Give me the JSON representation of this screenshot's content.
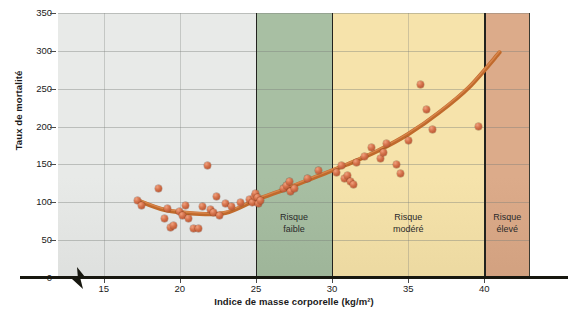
{
  "chart_data": {
    "type": "scatter",
    "title": "",
    "xlabel": "Indice de masse corporelle (kg/m²)",
    "ylabel": "Taux de mortalité",
    "xlim": [
      12,
      43
    ],
    "ylim": [
      0,
      350
    ],
    "xticks": [
      15,
      20,
      25,
      30,
      35,
      40
    ],
    "yticks": [
      0,
      50,
      100,
      150,
      200,
      250,
      300,
      350
    ],
    "grid": true,
    "legend": "none",
    "axis_break_x": true,
    "x": [
      17.2,
      17.5,
      18.6,
      19.0,
      19.2,
      19.4,
      19.6,
      20.0,
      20.2,
      20.4,
      20.6,
      20.9,
      21.2,
      21.5,
      21.8,
      22.0,
      22.2,
      22.4,
      22.6,
      23.0,
      23.4,
      24.0,
      24.6,
      24.8,
      24.9,
      25.0,
      25.1,
      25.2,
      25.3,
      26.8,
      27.0,
      27.2,
      27.3,
      27.5,
      28.4,
      29.1,
      30.3,
      30.6,
      30.8,
      31.0,
      31.2,
      31.4,
      31.6,
      32.1,
      32.6,
      33.2,
      33.4,
      33.6,
      34.2,
      34.5,
      35.0,
      35.8,
      36.2,
      36.6,
      39.6
    ],
    "y": [
      103,
      96,
      118,
      78,
      92,
      67,
      70,
      88,
      83,
      96,
      78,
      66,
      66,
      95,
      148,
      90,
      86,
      108,
      82,
      98,
      95,
      100,
      104,
      100,
      108,
      112,
      106,
      98,
      103,
      118,
      122,
      128,
      114,
      118,
      132,
      142,
      140,
      148,
      132,
      136,
      128,
      124,
      152,
      160,
      172,
      158,
      166,
      178,
      150,
      138,
      182,
      256,
      222,
      196,
      200
    ],
    "series": [
      {
        "name": "Taux de mortalité observé",
        "type": "scatter",
        "marker_color": "#c96a44"
      },
      {
        "name": "Courbe de tendance",
        "type": "line",
        "line_color": "#c06a2c",
        "points": [
          {
            "x": 17.3,
            "y": 102
          },
          {
            "x": 19.0,
            "y": 90
          },
          {
            "x": 21.0,
            "y": 85
          },
          {
            "x": 23.0,
            "y": 86
          },
          {
            "x": 25.0,
            "y": 103
          },
          {
            "x": 27.0,
            "y": 118
          },
          {
            "x": 29.0,
            "y": 134
          },
          {
            "x": 31.0,
            "y": 150
          },
          {
            "x": 33.0,
            "y": 168
          },
          {
            "x": 35.0,
            "y": 190
          },
          {
            "x": 37.0,
            "y": 218
          },
          {
            "x": 39.0,
            "y": 252
          },
          {
            "x": 41.0,
            "y": 298
          }
        ]
      }
    ],
    "zones": [
      {
        "label": "",
        "line1": "",
        "line2": "",
        "xmin": 12,
        "xmax": 25,
        "color": "#e8eae8"
      },
      {
        "label": "Risque faible",
        "line1": "Risque",
        "line2": "faible",
        "xmin": 25,
        "xmax": 30,
        "color": "#a8bfa3"
      },
      {
        "label": "Risque modéré",
        "line1": "Risque",
        "line2": "modéré",
        "xmin": 30,
        "xmax": 40,
        "color": "#f6e3ab"
      },
      {
        "label": "Risque élevé",
        "line1": "Risque",
        "line2": "élevé",
        "xmin": 40,
        "xmax": 43,
        "color": "#dcab8a"
      }
    ]
  },
  "axis": {
    "y_tick_labels": [
      "0",
      "50",
      "100",
      "150",
      "200",
      "250",
      "300",
      "350"
    ],
    "x_tick_labels": [
      "15",
      "20",
      "25",
      "30",
      "35",
      "40"
    ],
    "y_title": "Taux de mortalité",
    "x_title": "Indice de masse corporelle (kg/m²)"
  },
  "colors": {
    "zone_low": "#a8bfa3",
    "zone_moderate": "#f6e3ab",
    "zone_high": "#dcab8a",
    "zone_none": "#e8eae8",
    "curve": "#c06a2c",
    "marker": "#c96a44",
    "axis": "#17170f"
  }
}
